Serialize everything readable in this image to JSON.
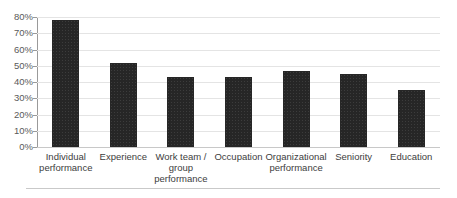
{
  "chart_data": {
    "type": "bar",
    "title": "",
    "subtitle": "",
    "xlabel": "",
    "ylabel": "",
    "ylim": [
      0,
      80
    ],
    "ytick_step": 10,
    "grid": true,
    "legend": false,
    "legend_position": "none",
    "orientation": "vertical",
    "categories": [
      "Individual performance",
      "Experience",
      "Work team / group performance",
      "Occupation",
      "Organizational performance",
      "Seniority",
      "Education"
    ],
    "values": [
      78,
      52,
      43,
      43,
      47,
      45,
      35
    ],
    "value_unit": "%",
    "ytick_labels": [
      "0%",
      "10%",
      "20%",
      "30%",
      "40%",
      "50%",
      "60%",
      "70%",
      "80%"
    ],
    "ytick_values": [
      0,
      10,
      20,
      30,
      40,
      50,
      60,
      70,
      80
    ],
    "bar_color": "#262626",
    "gridline_color": "#e4e4e4",
    "axis_color": "#9a9a9a",
    "tick_label_color": "#5a5a5a",
    "category_label_color": "#3d3d3d",
    "background_color": "#ffffff"
  },
  "axis": {
    "y_ticks": [
      {
        "label": "80%",
        "value": 80
      },
      {
        "label": "70%",
        "value": 70
      },
      {
        "label": "60%",
        "value": 60
      },
      {
        "label": "50%",
        "value": 50
      },
      {
        "label": "40%",
        "value": 40
      },
      {
        "label": "30%",
        "value": 30
      },
      {
        "label": "20%",
        "value": 20
      },
      {
        "label": "10%",
        "value": 10
      },
      {
        "label": "0%",
        "value": 0
      }
    ]
  },
  "bars": [
    {
      "label": "Individual performance",
      "value": 78
    },
    {
      "label": "Experience",
      "value": 52
    },
    {
      "label": "Work team / group performance",
      "value": 43
    },
    {
      "label": "Occupation",
      "value": 43
    },
    {
      "label": "Organizational performance",
      "value": 47
    },
    {
      "label": "Seniority",
      "value": 45
    },
    {
      "label": "Education",
      "value": 35
    }
  ]
}
